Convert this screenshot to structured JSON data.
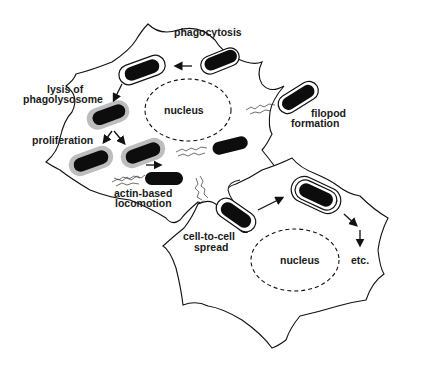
{
  "diagram": {
    "type": "biological-process",
    "cells": [
      {
        "id": "host-cell-1",
        "nucleus_label": "nucleus"
      },
      {
        "id": "host-cell-2",
        "nucleus_label": "nucleus"
      }
    ],
    "labels": {
      "phagocytosis": "phagocytosis",
      "lysis_line1": "lysis of",
      "lysis_line2": "phagolysosome",
      "nucleus1": "nucleus",
      "filopod_line1": "filopod",
      "filopod_line2": "formation",
      "proliferation": "proliferation",
      "actin_line1": "actin-based",
      "actin_line2": "locomotion",
      "spread_line1": "cell-to-cell",
      "spread_line2": "spread",
      "nucleus2": "nucleus",
      "etc": "etc."
    },
    "colors": {
      "bacterium": "#0d0d0d",
      "halo": "#bdbdbd",
      "outline": "#111111",
      "background": "#ffffff"
    },
    "steps": [
      "phagocytosis",
      "lysis of phagolysosome",
      "proliferation",
      "actin-based locomotion",
      "filopod formation",
      "cell-to-cell spread",
      "etc."
    ]
  }
}
